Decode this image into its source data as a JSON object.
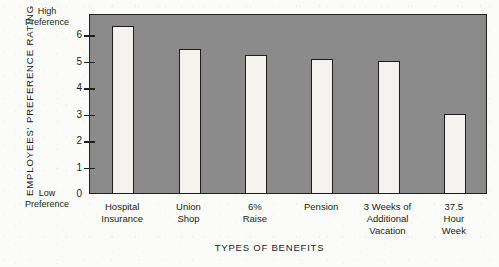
{
  "chart_data": {
    "type": "bar",
    "title": "",
    "xlabel": "TYPES OF BENEFITS",
    "ylabel": "EMPLOYEES' PREFERENCE RATING",
    "ylim": [
      0,
      6.8
    ],
    "yticks": [
      0,
      1,
      2,
      3,
      4,
      5,
      6
    ],
    "ytick_labels": [
      "0",
      "1",
      "2",
      "3",
      "4",
      "5",
      "6"
    ],
    "y_axis_high_caption": "High\nPreference",
    "y_axis_low_caption": "Low\nPreference",
    "grid": false,
    "legend": false,
    "categories": [
      "Hospital Insurance",
      "Union Shop",
      "6% Raise",
      "Pension",
      "3 Weeks of Additional Vacation",
      "37.5 Hour Week"
    ],
    "values": [
      6.3,
      5.45,
      5.2,
      5.05,
      5.0,
      3.0
    ],
    "bar_color": "#f4f3ef",
    "bar_edge_color": "#1d1d1d",
    "plot_background_color": "#8b8b8b"
  },
  "axis": {
    "y_title": "EMPLOYEES' PREFERENCE RATING",
    "x_title": "TYPES OF BENEFITS",
    "high_caption_line1": "High",
    "high_caption_line2": "Preference",
    "low_caption_line1": "Low",
    "low_caption_line2": "Preference",
    "ticks": [
      "6",
      "5",
      "4",
      "3",
      "2",
      "1",
      "0"
    ]
  },
  "categories": [
    {
      "line1": "Hospital",
      "line2": "Insurance",
      "line3": ""
    },
    {
      "line1": "Union",
      "line2": "Shop",
      "line3": ""
    },
    {
      "line1": "6%",
      "line2": "Raise",
      "line3": ""
    },
    {
      "line1": "Pension",
      "line2": "",
      "line3": ""
    },
    {
      "line1": "3 Weeks of",
      "line2": "Additional",
      "line3": "Vacation"
    },
    {
      "line1": "37.5",
      "line2": "Hour",
      "line3": "Week"
    }
  ]
}
